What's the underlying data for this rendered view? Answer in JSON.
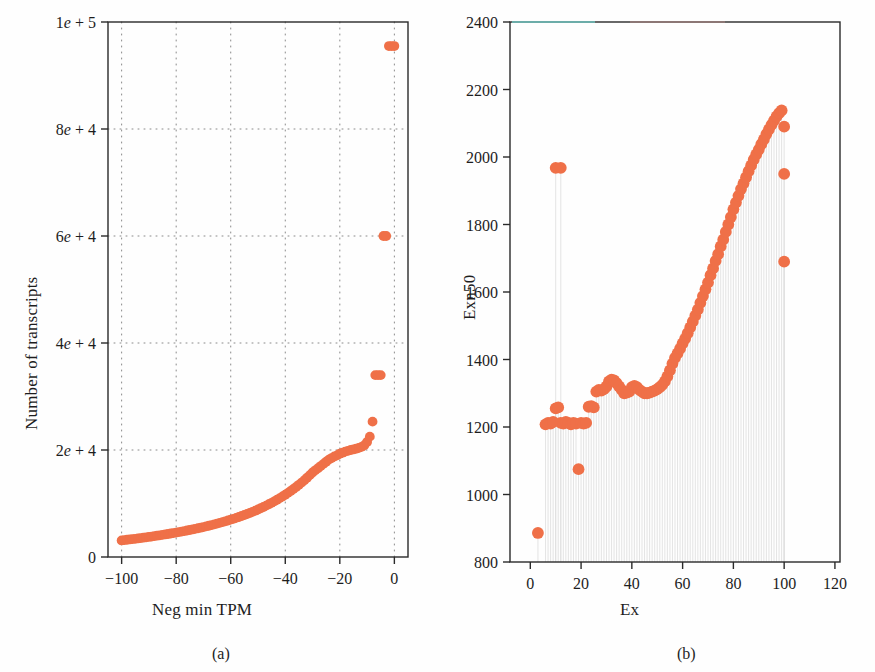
{
  "figure": {
    "background_color": "#fefefe",
    "marker_color": "#ef7048",
    "axis_color": "#2a2a2a",
    "grid_color": "#8a8a8a",
    "dropline_color": "#dedede"
  },
  "panels": [
    {
      "id": "a",
      "caption": "(a)",
      "xlabel": "Neg min TPM",
      "ylabel": "Number of transcripts"
    },
    {
      "id": "b",
      "caption": "(b)",
      "xlabel": "Ex",
      "ylabel": "Exn50"
    }
  ],
  "chart_data": [
    {
      "type": "scatter",
      "panel": "a",
      "title": "",
      "subtitle": "",
      "xlabel": "Neg min TPM",
      "ylabel": "Number of transcripts",
      "xlim": [
        -105,
        5
      ],
      "ylim": [
        0,
        100000
      ],
      "xticks": [
        -100,
        -80,
        -60,
        -40,
        -20,
        0
      ],
      "xticklabels": [
        "−100",
        "−80",
        "−60",
        "−40",
        "−20",
        "0"
      ],
      "yticks": [
        0,
        20000,
        40000,
        60000,
        80000,
        100000
      ],
      "yticklabels": [
        "0",
        "2e + 4",
        "4e + 4",
        "6e + 4",
        "8e + 4",
        "1e + 5"
      ],
      "grid": true,
      "grid_style": "dotted",
      "legend": null,
      "marker_color": "#ef7048",
      "marker_size": 7,
      "x": [
        -100,
        -99,
        -98,
        -97,
        -96,
        -95,
        -94,
        -93,
        -92,
        -91,
        -90,
        -89,
        -88,
        -87,
        -86,
        -85,
        -84,
        -83,
        -82,
        -81,
        -80,
        -79,
        -78,
        -77,
        -76,
        -75,
        -74,
        -73,
        -72,
        -71,
        -70,
        -69,
        -68,
        -67,
        -66,
        -65,
        -64,
        -63,
        -62,
        -61,
        -60,
        -59,
        -58,
        -57,
        -56,
        -55,
        -54,
        -53,
        -52,
        -51,
        -50,
        -49,
        -48,
        -47,
        -46,
        -45,
        -44,
        -43,
        -42,
        -41,
        -40,
        -39,
        -38,
        -37,
        -36,
        -35,
        -34,
        -33,
        -32,
        -31,
        -30,
        -29,
        -28,
        -27,
        -26,
        -25,
        -24,
        -23,
        -22,
        -21,
        -20,
        -19,
        -18,
        -17,
        -16,
        -15,
        -14,
        -13,
        -12,
        -11,
        -10,
        -9,
        -8,
        -7,
        -6,
        -5,
        -4,
        -3,
        -2,
        -1,
        0
      ],
      "y": [
        3100,
        3160,
        3220,
        3280,
        3340,
        3400,
        3470,
        3540,
        3610,
        3680,
        3750,
        3820,
        3900,
        3980,
        4060,
        4140,
        4220,
        4300,
        4390,
        4480,
        4570,
        4660,
        4750,
        4850,
        4950,
        5050,
        5150,
        5260,
        5370,
        5480,
        5600,
        5720,
        5840,
        5970,
        6100,
        6240,
        6380,
        6520,
        6670,
        6820,
        6980,
        7140,
        7310,
        7480,
        7660,
        7850,
        8040,
        8240,
        8450,
        8660,
        8880,
        9110,
        9350,
        9600,
        9860,
        10130,
        10410,
        10700,
        11000,
        11320,
        11650,
        11990,
        12350,
        12720,
        13100,
        13500,
        13920,
        14360,
        14820,
        15300,
        15800,
        16200,
        16600,
        17000,
        17400,
        17800,
        18200,
        18500,
        18800,
        19000,
        19300,
        19500,
        19700,
        19850,
        20000,
        20100,
        20250,
        20400,
        20600,
        20900,
        21500,
        22500,
        25300,
        34000,
        34000,
        34000,
        60000,
        60000,
        95500,
        95500,
        95500
      ],
      "notable_points": [
        {
          "x": 0,
          "y": 95500,
          "note": "top outlier near zero"
        },
        {
          "x": 0,
          "y": 60000,
          "note": "second outlier"
        },
        {
          "x": -3,
          "y": 34000,
          "note": "third outlier"
        },
        {
          "x": -5,
          "y": 25300,
          "note": "fourth outlier"
        },
        {
          "x": -7,
          "y": 22000,
          "note": "fifth outlier"
        },
        {
          "x": -9,
          "y": 20000,
          "note": "knee of curve"
        },
        {
          "x": -100,
          "y": 3100,
          "note": "left end of curve"
        }
      ]
    },
    {
      "type": "scatter",
      "panel": "b",
      "title": "",
      "subtitle": "",
      "xlabel": "Ex",
      "ylabel": "Exn50",
      "xlim": [
        -8,
        122
      ],
      "ylim": [
        800,
        2400
      ],
      "xticks": [
        0,
        20,
        40,
        60,
        80,
        100,
        120
      ],
      "xticklabels": [
        "0",
        "20",
        "40",
        "60",
        "80",
        "100",
        "120"
      ],
      "yticks": [
        800,
        1000,
        1200,
        1400,
        1600,
        1800,
        2000,
        2200,
        2400
      ],
      "yticklabels": [
        "800",
        "1000",
        "1200",
        "1400",
        "1600",
        "1800",
        "2000",
        "2200",
        "2400"
      ],
      "grid": false,
      "legend": null,
      "marker_color": "#ef7048",
      "marker_size": 9,
      "x": [
        3,
        6,
        7,
        8,
        9,
        10,
        11,
        12,
        13,
        14,
        15,
        16,
        17,
        18,
        19,
        20,
        21,
        22,
        23,
        24,
        25,
        26,
        27,
        28,
        29,
        30,
        31,
        32,
        33,
        34,
        35,
        36,
        37,
        38,
        39,
        40,
        41,
        42,
        43,
        44,
        45,
        46,
        47,
        48,
        49,
        50,
        51,
        52,
        53,
        54,
        55,
        56,
        57,
        58,
        59,
        60,
        61,
        62,
        63,
        64,
        65,
        66,
        67,
        68,
        69,
        70,
        71,
        72,
        73,
        74,
        75,
        76,
        77,
        78,
        79,
        80,
        81,
        82,
        83,
        84,
        85,
        86,
        87,
        88,
        89,
        90,
        91,
        92,
        93,
        94,
        95,
        96,
        97,
        98,
        99,
        100,
        100,
        100,
        10,
        12
      ],
      "y": [
        886,
        1208,
        1212,
        1210,
        1215,
        1255,
        1258,
        1212,
        1210,
        1215,
        1212,
        1208,
        1212,
        1210,
        1075,
        1212,
        1210,
        1212,
        1260,
        1262,
        1258,
        1305,
        1310,
        1308,
        1312,
        1320,
        1335,
        1340,
        1338,
        1330,
        1320,
        1310,
        1300,
        1302,
        1305,
        1318,
        1322,
        1318,
        1310,
        1305,
        1300,
        1300,
        1302,
        1305,
        1308,
        1312,
        1318,
        1325,
        1335,
        1350,
        1368,
        1388,
        1405,
        1418,
        1432,
        1448,
        1462,
        1478,
        1495,
        1512,
        1530,
        1548,
        1568,
        1588,
        1608,
        1628,
        1650,
        1670,
        1692,
        1712,
        1735,
        1755,
        1778,
        1800,
        1822,
        1845,
        1865,
        1885,
        1905,
        1922,
        1940,
        1958,
        1975,
        1992,
        2008,
        2022,
        2038,
        2052,
        2068,
        2082,
        2095,
        2108,
        2120,
        2130,
        2138,
        2090,
        1950,
        1690,
        1968,
        1968
      ],
      "notable_points": [
        {
          "x": 3,
          "y": 886,
          "note": "lowest-left isolated point"
        },
        {
          "x": 10,
          "y": 1968,
          "note": "high isolated pair left"
        },
        {
          "x": 12,
          "y": 1968,
          "note": "high isolated pair left"
        },
        {
          "x": 19,
          "y": 1075,
          "note": "low dip point"
        },
        {
          "x": 96,
          "y": 2138,
          "note": "peak of the rising curve"
        },
        {
          "x": 100,
          "y": 1950,
          "note": "right outlier high"
        },
        {
          "x": 100,
          "y": 1690,
          "note": "right outlier mid"
        },
        {
          "x": 100,
          "y": 1300,
          "note": "right outlier low"
        }
      ]
    }
  ]
}
